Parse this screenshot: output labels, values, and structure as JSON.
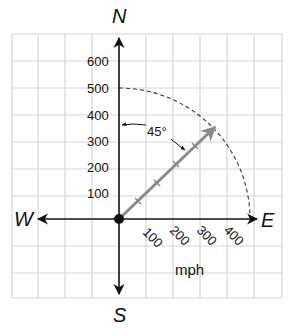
{
  "diagram": {
    "compass": {
      "north": "N",
      "south": "S",
      "east": "E",
      "west": "W"
    },
    "north_axis_ticks": [
      "100",
      "200",
      "300",
      "400",
      "500",
      "600"
    ],
    "vector_axis_ticks": [
      "100",
      "200",
      "300",
      "400"
    ],
    "unit_label": "mph",
    "angle_label": "45°",
    "vector": {
      "magnitude_mph": 500,
      "bearing_deg_from_north": 45,
      "color": "#8a8a8a"
    },
    "arc_radius_mph": 500,
    "colors": {
      "grid": "#d6d6d6",
      "axes": "#111111",
      "vector": "#8a8a8a",
      "arc": "#333333"
    }
  }
}
